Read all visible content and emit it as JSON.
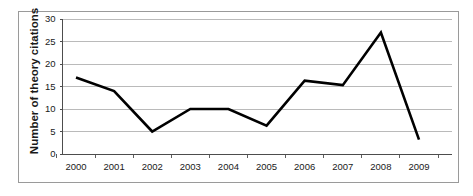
{
  "chart_data": {
    "type": "line",
    "title": "",
    "subtitle": "",
    "xlabel": "",
    "ylabel": "Number of theory citations",
    "categories": [
      "2000",
      "2001",
      "2002",
      "2003",
      "2004",
      "2005",
      "2006",
      "2007",
      "2008",
      "2009"
    ],
    "values": [
      17,
      14,
      5,
      10,
      10,
      6.3,
      16.3,
      15.3,
      27,
      3.2
    ],
    "series": [
      {
        "name": "Number of theory citations",
        "values": [
          17,
          14,
          5,
          10,
          10,
          6.3,
          16.3,
          15.3,
          27,
          3.2
        ]
      }
    ],
    "ylim": [
      0,
      30
    ],
    "yticks": [
      0,
      5,
      10,
      15,
      20,
      25,
      30
    ],
    "ytick_labels": [
      "0",
      "5",
      "10",
      "15",
      "20",
      "25",
      "30"
    ],
    "xtick_labels": [
      "2000",
      "2001",
      "2002",
      "2003",
      "2004",
      "2005",
      "2006",
      "2007",
      "2008",
      "2009"
    ],
    "grid": "horizontal",
    "legend": "none",
    "line_color": "#000000",
    "grid_color": "#b3b3b3",
    "axis_color": "#4d4d4d",
    "frame_color": "#9a9a9a",
    "background": "#ffffff"
  }
}
